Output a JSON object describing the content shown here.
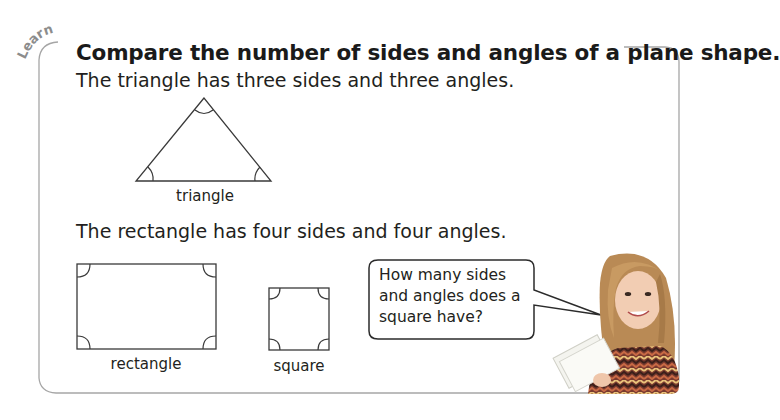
{
  "section": {
    "tag": "Learn",
    "title": "Compare the number of sides and angles of a plane shape."
  },
  "triangle": {
    "description": "The triangle has three sides and three angles.",
    "label": "triangle",
    "sides": 3,
    "angles": 3
  },
  "quadrilaterals": {
    "description": "The rectangle has four sides and four angles.",
    "shapes": [
      {
        "label": "rectangle",
        "sides": 4,
        "angles": 4
      },
      {
        "label": "square",
        "sides": 4,
        "angles": 4
      }
    ]
  },
  "speech_bubble": {
    "text": "How many sides and angles does a square have?",
    "speaker": "girl-with-books"
  },
  "colors": {
    "frame": "#9a9a9a",
    "stroke": "#231f20",
    "tag": "#8c8c8c"
  }
}
